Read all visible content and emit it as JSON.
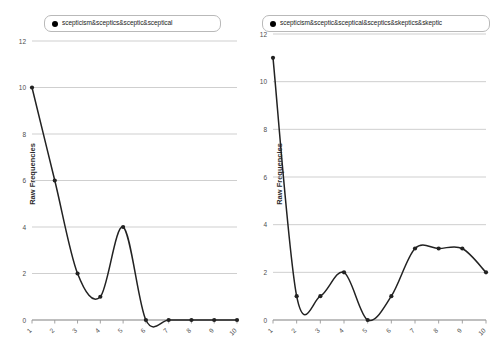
{
  "chart_data": [
    {
      "type": "line",
      "title": "",
      "legend": "scepticism&sceptics&sceptic&sceptical",
      "legend_position": "top",
      "xlabel": "",
      "ylabel": "Raw Frequencies",
      "categories": [
        "1",
        "2",
        "3",
        "4",
        "5",
        "6",
        "7",
        "8",
        "9",
        "10"
      ],
      "x": [
        1,
        2,
        3,
        4,
        5,
        6,
        7,
        8,
        9,
        10
      ],
      "values": [
        10,
        6,
        2,
        1,
        4,
        0,
        0,
        0,
        0,
        0
      ],
      "yticks": [
        0,
        2,
        4,
        6,
        8,
        10,
        12
      ],
      "ylim": [
        0,
        12
      ],
      "xlim": [
        1,
        10
      ],
      "grid": true,
      "marker": "circle",
      "line_color": "#222222",
      "grid_color": "#c9c9c9"
    },
    {
      "type": "line",
      "title": "",
      "legend": "scepticism&sceptic&sceptical&sceptics&skeptics&skeptic",
      "legend_position": "top",
      "xlabel": "",
      "ylabel": "Raw Frequencies",
      "categories": [
        "1",
        "2",
        "3",
        "4",
        "5",
        "6",
        "7",
        "8",
        "9",
        "10"
      ],
      "x": [
        1,
        2,
        3,
        4,
        5,
        6,
        7,
        8,
        9,
        10
      ],
      "values": [
        11,
        1,
        1,
        2,
        0,
        1,
        3,
        3,
        3,
        2
      ],
      "yticks": [
        0,
        2,
        4,
        6,
        8,
        10,
        12
      ],
      "ylim": [
        0,
        12
      ],
      "xlim": [
        1,
        10
      ],
      "grid": true,
      "marker": "circle",
      "line_color": "#222222",
      "grid_color": "#c9c9c9"
    }
  ],
  "left_panel": {
    "legend_label": "scepticism&sceptics&sceptic&sceptical",
    "ylabel": "Raw Frequencies"
  },
  "right_panel": {
    "legend_label": "scepticism&sceptic&sceptical&sceptics&skeptics&skeptic",
    "ylabel": "Raw Frequencies"
  }
}
